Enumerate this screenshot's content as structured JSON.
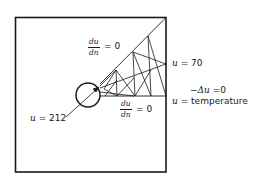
{
  "figure": {
    "type": "finite-element-mesh-diagram",
    "colors": {
      "stroke": "#1a1a1a",
      "background": "#ffffff"
    }
  },
  "labels": {
    "top_bc": {
      "numerator": "du",
      "denominator": "dn",
      "equals": "= 0"
    },
    "bottom_bc": {
      "numerator": "du",
      "denominator": "dn",
      "equals": "= 0"
    },
    "outer_bc": {
      "var": "u",
      "equals": "= 70"
    },
    "inner_bc": {
      "var": "u",
      "equals": "= 212"
    },
    "pde": {
      "lhs": "−Δu",
      "equals": "=0"
    },
    "meaning": {
      "var": "u",
      "equals": "=",
      "text": "temperature"
    }
  }
}
